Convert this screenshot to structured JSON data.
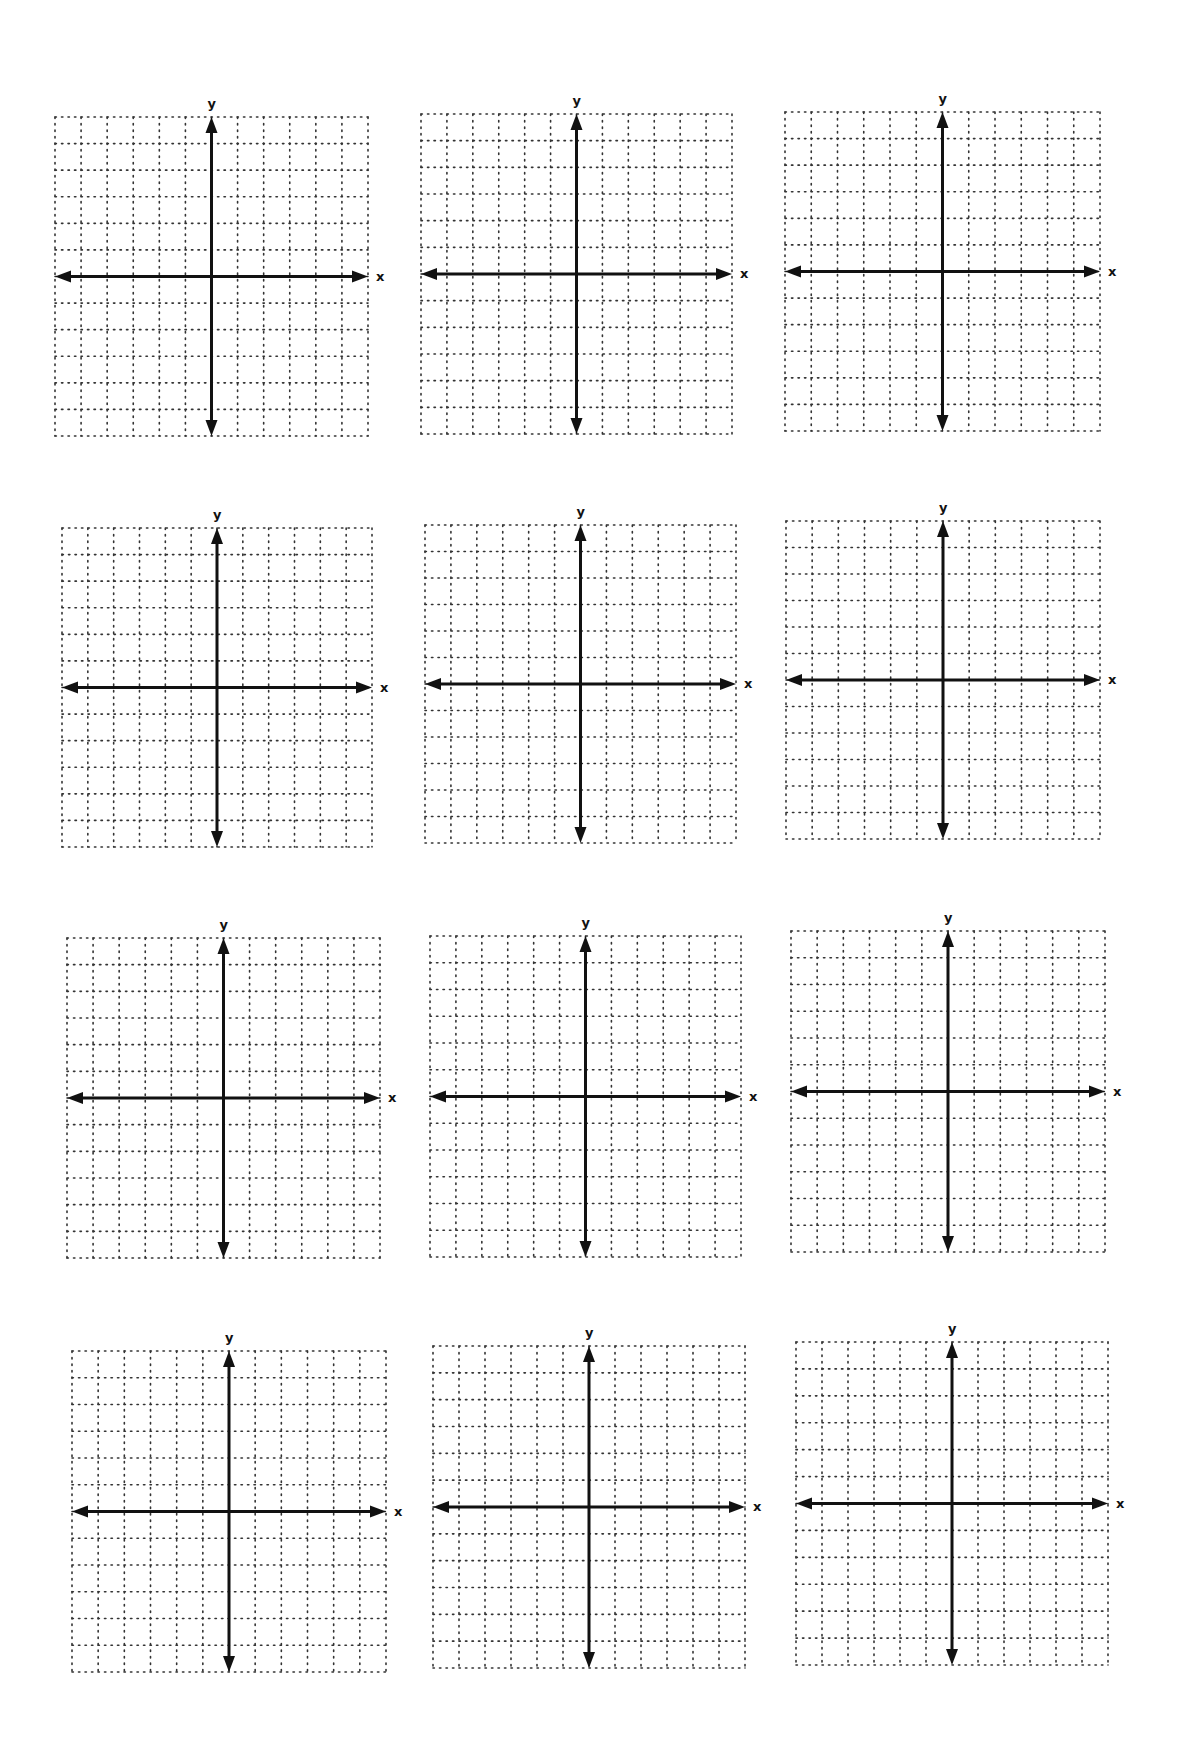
{
  "worksheet": {
    "type": "blank coordinate plane grids",
    "rows": 4,
    "columns": 3,
    "grid_cells_per_side": 12,
    "colors": {
      "grid_dots": "#333333",
      "axes": "#111111",
      "background": "#ffffff"
    },
    "planes": [
      {
        "x_label": "x",
        "y_label": "y",
        "left": 55,
        "top": 117,
        "width": 313,
        "height": 319
      },
      {
        "x_label": "x",
        "y_label": "y",
        "left": 421,
        "top": 114,
        "width": 311,
        "height": 320
      },
      {
        "x_label": "x",
        "y_label": "y",
        "left": 785,
        "top": 112,
        "width": 315,
        "height": 319
      },
      {
        "x_label": "x",
        "y_label": "y",
        "left": 62,
        "top": 528,
        "width": 310,
        "height": 319
      },
      {
        "x_label": "x",
        "y_label": "y",
        "left": 425,
        "top": 525,
        "width": 311,
        "height": 318
      },
      {
        "x_label": "x",
        "y_label": "y",
        "left": 786,
        "top": 521,
        "width": 314,
        "height": 318
      },
      {
        "x_label": "x",
        "y_label": "y",
        "left": 67,
        "top": 938,
        "width": 313,
        "height": 320
      },
      {
        "x_label": "x",
        "y_label": "y",
        "left": 430,
        "top": 936,
        "width": 311,
        "height": 321
      },
      {
        "x_label": "x",
        "y_label": "y",
        "left": 791,
        "top": 931,
        "width": 314,
        "height": 321
      },
      {
        "x_label": "x",
        "y_label": "y",
        "left": 72,
        "top": 1351,
        "width": 314,
        "height": 321
      },
      {
        "x_label": "x",
        "y_label": "y",
        "left": 433,
        "top": 1346,
        "width": 312,
        "height": 322
      },
      {
        "x_label": "x",
        "y_label": "y",
        "left": 796,
        "top": 1342,
        "width": 312,
        "height": 323
      }
    ]
  }
}
